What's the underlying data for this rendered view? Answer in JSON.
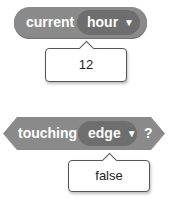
{
  "blocks": [
    {
      "type": "reporter",
      "label": "current",
      "dropdown": {
        "value": "hour",
        "caret": "▼"
      },
      "result": "12"
    },
    {
      "type": "boolean",
      "label": "touching",
      "dropdown": {
        "value": "edge",
        "caret": "▼"
      },
      "suffix": "?",
      "result": "false"
    }
  ],
  "colors": {
    "block": "#8a8a8a",
    "dropdown": "#6e6e6e",
    "text": "#ffffff"
  }
}
